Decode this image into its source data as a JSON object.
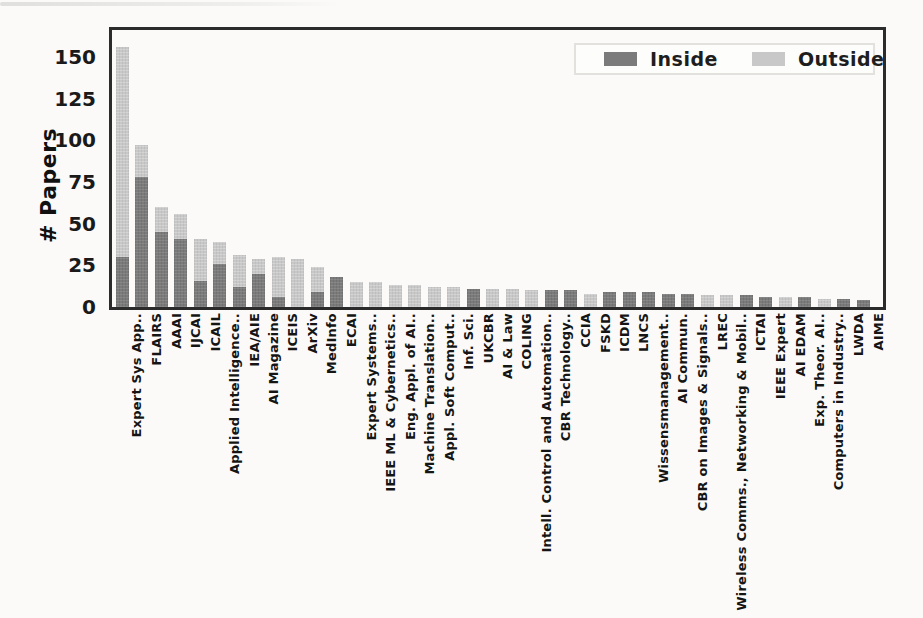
{
  "figure": {
    "ylabel": "# Papers",
    "yticks": [
      0,
      25,
      50,
      75,
      100,
      125,
      150
    ],
    "legend": {
      "inside_label": "Inside",
      "outside_label": "Outside"
    },
    "colors": {
      "inside": "#7b7b7b",
      "outside": "#c8c8c8",
      "frame": "#2b2b2b"
    }
  },
  "chart_data": {
    "type": "bar",
    "stacked": true,
    "title": "",
    "xlabel": "",
    "ylabel": "# Papers",
    "ylim": [
      0,
      166
    ],
    "yticks": [
      0,
      25,
      50,
      75,
      100,
      125,
      150
    ],
    "grid": false,
    "legend_position": "upper right",
    "categories": [
      "Expert Sys App..",
      "FLAIRS",
      "AAAI",
      "IJCAI",
      "ICAIL",
      "Applied Intelligence..",
      "IEA/AIE",
      "AI Magazine",
      "ICEIS",
      "ArXiv",
      "MedInfo",
      "ECAI",
      "Expert Systems..",
      "IEEE ML & Cybernetics..",
      "Eng. Appl. of AI..",
      "Machine Translation..",
      "Appl. Soft Comput..",
      "Inf. Sci.",
      "UKCBR",
      "AI & Law",
      "COLING",
      "Intell. Control and Automation..",
      "CBR Technology..",
      "CCIA",
      "FSKD",
      "ICDM",
      "LNCS",
      "Wissensmanagement..",
      "AI Commun.",
      "CBR on Images & Signals..",
      "LREC",
      "Wireless Comms., Networking & Mobil..",
      "ICTAI",
      "IEEE Expert",
      "AI EDAM",
      "Exp. Theor. AI..",
      "Computers in Industry..",
      "LWDA",
      "AIME"
    ],
    "series": [
      {
        "name": "Inside",
        "color": "#7b7b7b",
        "values": [
          30,
          78,
          45,
          41,
          16,
          26,
          12,
          20,
          6,
          0,
          9,
          18,
          0,
          0,
          0,
          0,
          0,
          0,
          11,
          0,
          0,
          0,
          10,
          10,
          0,
          9,
          9,
          9,
          8,
          8,
          0,
          0,
          7,
          6,
          0,
          6,
          0,
          5,
          4
        ]
      },
      {
        "name": "Outside",
        "color": "#c8c8c8",
        "values": [
          126,
          19,
          15,
          15,
          25,
          13,
          19,
          9,
          24,
          29,
          15,
          0,
          15,
          15,
          13,
          13,
          12,
          12,
          0,
          11,
          11,
          10,
          0,
          0,
          8,
          0,
          0,
          0,
          0,
          0,
          7,
          7,
          0,
          0,
          6,
          0,
          5,
          0,
          0
        ]
      }
    ]
  }
}
